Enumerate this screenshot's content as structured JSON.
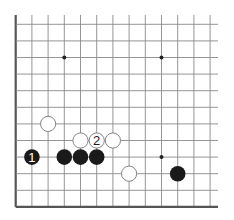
{
  "diagram": {
    "type": "go-board-fragment",
    "colors": {
      "background": "#ffffff",
      "line": "#8a8a8a",
      "edge": "#555555",
      "black_stone": "#1a1a1a",
      "white_stone": "#ffffff",
      "white_stone_border": "#777777"
    },
    "grid": {
      "columns": 13,
      "rows": 12,
      "origin_x": 15.7,
      "origin_y": 24.3,
      "spacing_x": 16.2,
      "spacing_y": 16.6,
      "left_edge": true,
      "bottom_edge": true,
      "top_edge": false,
      "right_edge": false
    },
    "star_points": [
      {
        "col": 3,
        "row": 2
      },
      {
        "col": 9,
        "row": 2
      },
      {
        "col": 9,
        "row": 8
      }
    ],
    "stones": [
      {
        "color": "white",
        "col": 2,
        "row": 6,
        "label": ""
      },
      {
        "color": "white",
        "col": 4,
        "row": 7,
        "label": ""
      },
      {
        "color": "white",
        "col": 5,
        "row": 7,
        "label": "2"
      },
      {
        "color": "white",
        "col": 6,
        "row": 7,
        "label": ""
      },
      {
        "color": "white",
        "col": 7,
        "row": 9,
        "label": ""
      },
      {
        "color": "black",
        "col": 1,
        "row": 8,
        "label": "1"
      },
      {
        "color": "black",
        "col": 3,
        "row": 8,
        "label": ""
      },
      {
        "color": "black",
        "col": 4,
        "row": 8,
        "label": ""
      },
      {
        "color": "black",
        "col": 5,
        "row": 8,
        "label": ""
      },
      {
        "color": "black",
        "col": 10,
        "row": 9,
        "label": ""
      }
    ]
  }
}
